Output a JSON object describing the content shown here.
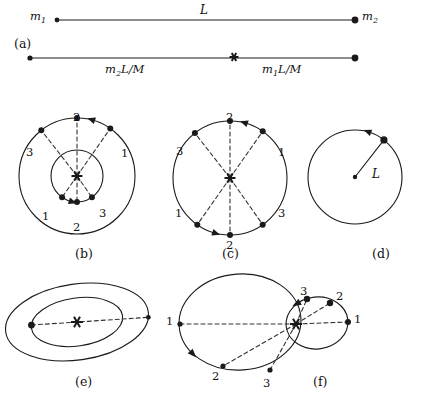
{
  "figure": {
    "kind": "physics-diagram",
    "stroke_color": "#1a1a1a",
    "dash_color": "#333333",
    "background": "#ffffff"
  },
  "panels": [
    {
      "id": "a",
      "label": "(a)",
      "label_x": 14,
      "label_y": 38
    },
    {
      "id": "b",
      "label": "(b)",
      "label_x": 75,
      "label_y": 248
    },
    {
      "id": "c",
      "label": "(c)",
      "label_x": 222,
      "label_y": 248
    },
    {
      "id": "d",
      "label": "(d)",
      "label_x": 372,
      "label_y": 248
    },
    {
      "id": "e",
      "label": "(e)",
      "label_x": 75,
      "label_y": 376
    },
    {
      "id": "f",
      "label": "(f)",
      "label_x": 313,
      "label_y": 376
    }
  ],
  "panel_a": {
    "top_line": {
      "x1": 57,
      "y1": 20,
      "x2": 355,
      "y2": 20
    },
    "top_dot_left": {
      "cx": 57,
      "cy": 20,
      "r": 2.4
    },
    "top_dot_right": {
      "cx": 355,
      "cy": 20,
      "r": 3.4
    },
    "bottom_line": {
      "x1": 30,
      "y1": 58,
      "x2": 355,
      "y2": 58
    },
    "bottom_dot_left": {
      "cx": 30,
      "cy": 58,
      "r": 2.6
    },
    "bottom_dot_right": {
      "cx": 355,
      "cy": 58,
      "r": 3.4
    },
    "com_marker": {
      "cx": 234,
      "cy": 57,
      "size": 9
    },
    "labels": {
      "m1": {
        "base": "m",
        "sub": "1",
        "x": 30,
        "y": 11
      },
      "m2": {
        "base": "m",
        "sub": "2",
        "x": 362,
        "y": 11
      },
      "L": {
        "text": "L",
        "x": 200,
        "y": 4
      },
      "left_segment": {
        "base": "m",
        "sub": "2",
        "tail": "L/M",
        "x": 105,
        "y": 64
      },
      "right_segment": {
        "base": "m",
        "sub": "1",
        "tail": "L/M",
        "x": 262,
        "y": 64
      }
    }
  },
  "panel_b": {
    "center": {
      "x": 77,
      "y": 176
    },
    "com_marker_size": 11,
    "outer_circle": {
      "r": 58
    },
    "inner_circle": {
      "r": 26
    },
    "outer_points": [
      {
        "label": "1",
        "angle_deg": 55,
        "lx": 121,
        "ly": 148
      },
      {
        "label": "2",
        "angle_deg": 90,
        "lx": 73,
        "ly": 112
      },
      {
        "label": "3",
        "angle_deg": 128,
        "lx": 26,
        "ly": 147
      }
    ],
    "inner_points": [
      {
        "label": "1",
        "angle_deg": 235,
        "lx": 42,
        "ly": 211
      },
      {
        "label": "2",
        "angle_deg": 270,
        "lx": 73,
        "ly": 222
      },
      {
        "label": "3",
        "angle_deg": 305,
        "lx": 99,
        "ly": 208
      }
    ],
    "outer_arrow_angle_deg": 72,
    "inner_arrow_angle_deg": 252
  },
  "panel_c": {
    "center": {
      "x": 230,
      "y": 178
    },
    "com_marker_size": 11,
    "circle": {
      "r": 57
    },
    "points": [
      {
        "label": "1",
        "angle_deg": 55,
        "lx": 278,
        "ly": 147
      },
      {
        "label": "2",
        "angle_deg": 90,
        "lx": 226,
        "ly": 112
      },
      {
        "label": "3",
        "angle_deg": 128,
        "lx": 176,
        "ly": 146
      },
      {
        "label": "1",
        "angle_deg": 235,
        "lx": 175,
        "ly": 208
      },
      {
        "label": "2",
        "angle_deg": 270,
        "lx": 226,
        "ly": 240
      },
      {
        "label": "3",
        "angle_deg": 305,
        "lx": 278,
        "ly": 208
      }
    ],
    "arrow_top_angle_deg": 72,
    "arrow_bottom_angle_deg": 252
  },
  "panel_d": {
    "center": {
      "x": 355,
      "y": 177
    },
    "circle": {
      "r": 47
    },
    "center_dot_r": 2.2,
    "body_angle_deg": 52,
    "body_dot_r": 3.6,
    "radius_label": {
      "text": "L",
      "x": 372,
      "y": 168
    },
    "arrow_angle_deg": 70
  },
  "panel_e": {
    "center": {
      "x": 77,
      "y": 322
    },
    "com_marker_size": 12,
    "outer_ellipse": {
      "rx": 72,
      "ry": 38,
      "rotate_deg": -8
    },
    "inner_ellipse": {
      "rx": 46,
      "ry": 24,
      "rotate_deg": -8
    },
    "chord_angle_deg": 172,
    "body_inner": {
      "r": 3.4
    },
    "body_outer": {
      "r": 2.4
    }
  },
  "panel_f": {
    "focus": {
      "x": 296,
      "y": 324
    },
    "big_ellipse": {
      "cx": 240,
      "cy": 322,
      "rx": 61,
      "ry": 48,
      "rotate_deg": -4
    },
    "small_ellipse": {
      "cx": 317,
      "cy": 323,
      "rx": 31,
      "ry": 26,
      "rotate_deg": -6
    },
    "big_points": [
      {
        "label": "1",
        "x": 180,
        "y": 324,
        "lx": 166,
        "ly": 316,
        "r": 2.6
      },
      {
        "label": "2",
        "x": 223,
        "y": 366,
        "lx": 212,
        "ly": 371,
        "r": 2.6
      },
      {
        "label": "3",
        "x": 270,
        "y": 370,
        "lx": 263,
        "ly": 378,
        "r": 2.6
      }
    ],
    "small_points": [
      {
        "label": "1",
        "x": 348,
        "y": 322,
        "lx": 354,
        "ly": 314,
        "r": 3.0
      },
      {
        "label": "2",
        "x": 330,
        "y": 303,
        "lx": 336,
        "ly": 291,
        "r": 3.2
      },
      {
        "label": "3",
        "x": 307,
        "y": 299,
        "lx": 300,
        "ly": 286,
        "r": 3.2
      }
    ],
    "arrow_big_angle_deg": 212,
    "arrow_small_deg": 118
  },
  "text_values": {
    "numbers": [
      "1",
      "2",
      "3"
    ],
    "length_symbol": "L",
    "mass_symbols": [
      "m1",
      "m2"
    ],
    "total_mass_symbol": "M",
    "segment_expressions": [
      "m2L/M",
      "m1L/M"
    ],
    "panel_letters": [
      "(a)",
      "(b)",
      "(c)",
      "(d)",
      "(e)",
      "(f)"
    ]
  }
}
